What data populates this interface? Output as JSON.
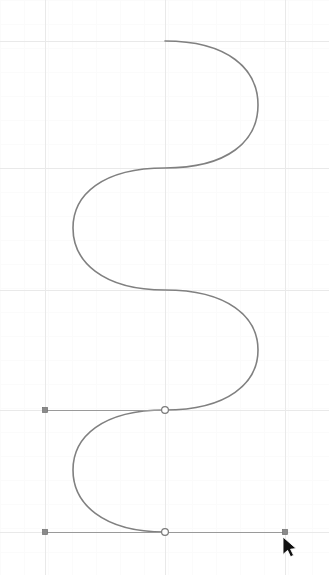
{
  "canvas": {
    "name": "vector-curve-editor-canvas",
    "width": 329,
    "height": 575,
    "background_color": "#ffffff"
  },
  "grid": {
    "major_color": "#e9e9e9",
    "minor_color": "#fbfbfb",
    "major_spacing": 120,
    "minor_spacing": 24,
    "major_x": [
      45,
      165,
      285
    ],
    "major_y": [
      41,
      168,
      290,
      410,
      532
    ],
    "visible": true
  },
  "curve": {
    "name": "s-spline",
    "stroke_color": "#808080",
    "stroke_width": 1.6,
    "type": "cubic-bezier-spline",
    "path": "M 165 41 C 228 41 258 69 258 105 C 258 141 228 168 165 168 C 102 168 73 195 73 228 C 73 261 102 290 165 290 C 228 290 258 317 258 350 C 258 383 228 410 165 410 C 102 410 73 437 73 470 C 73 503 102 532 165 532",
    "anchors_xy": [
      [
        165,
        41
      ],
      [
        165,
        168
      ],
      [
        165,
        290
      ],
      [
        165,
        410
      ],
      [
        165,
        532
      ]
    ],
    "extrema_xy": [
      [
        258,
        105
      ],
      [
        73,
        228
      ],
      [
        258,
        350
      ],
      [
        73,
        470
      ]
    ]
  },
  "handles": [
    {
      "name": "handle-upper",
      "y": 410,
      "line_from_x": 45,
      "line_to_x": 165,
      "points": [
        {
          "kind": "control-point-filled",
          "x": 45,
          "y": 410
        },
        {
          "kind": "anchor-point-hollow",
          "x": 165,
          "y": 410
        }
      ]
    },
    {
      "name": "handle-lower",
      "y": 532,
      "line_from_x": 45,
      "line_to_x": 285,
      "points": [
        {
          "kind": "control-point-filled",
          "x": 45,
          "y": 532
        },
        {
          "kind": "anchor-point-hollow",
          "x": 165,
          "y": 532
        },
        {
          "kind": "control-point-filled",
          "x": 285,
          "y": 532
        }
      ]
    }
  ],
  "handle_style": {
    "line_color": "#9a9a9a",
    "control_fill": "#8a8a8a",
    "control_stroke": "#6e6e6e",
    "anchor_fill": "#ffffff",
    "anchor_stroke": "#7a7a7a",
    "control_size": 5,
    "anchor_radius": 3.4
  },
  "cursor": {
    "name": "mouse-pointer",
    "x": 283,
    "y": 537,
    "fill": "#101010",
    "outline": "#ffffff"
  }
}
